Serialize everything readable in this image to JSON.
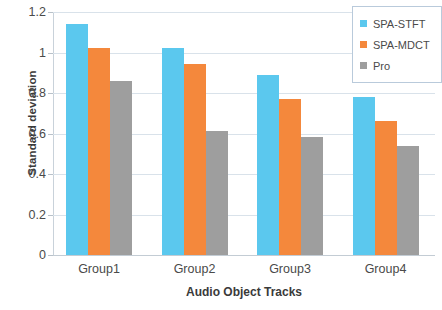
{
  "chart_data": {
    "type": "bar",
    "title": "",
    "xlabel": "Audio Object Tracks",
    "ylabel": "Standard deviation",
    "categories": [
      "Group1",
      "Group2",
      "Group3",
      "Group4"
    ],
    "series": [
      {
        "name": "SPA-STFT",
        "color": "#5bc8ee",
        "values": [
          1.14,
          1.02,
          0.89,
          0.78
        ]
      },
      {
        "name": "SPA-MDCT",
        "color": "#f4883c",
        "values": [
          1.02,
          0.945,
          0.77,
          0.66
        ]
      },
      {
        "name": "Pro",
        "color": "#9e9e9e",
        "values": [
          0.86,
          0.61,
          0.585,
          0.54
        ]
      }
    ],
    "ylim": [
      0,
      1.2
    ],
    "yticks": [
      0,
      0.2,
      0.4,
      0.6,
      0.8,
      1,
      1.2
    ],
    "ytick_labels": [
      "0",
      "0.2",
      "0.4",
      "0.6",
      "0.8",
      "1",
      "1.2"
    ],
    "grid": true,
    "legend_position": "top-right"
  },
  "legend": {
    "entries": [
      {
        "label": "SPA-STFT",
        "color": "#5bc8ee"
      },
      {
        "label": "SPA-MDCT",
        "color": "#f4883c"
      },
      {
        "label": "Pro",
        "color": "#9e9e9e"
      }
    ]
  },
  "axes": {
    "y_title": "Standard deviation",
    "x_title": "Audio Object Tracks"
  }
}
